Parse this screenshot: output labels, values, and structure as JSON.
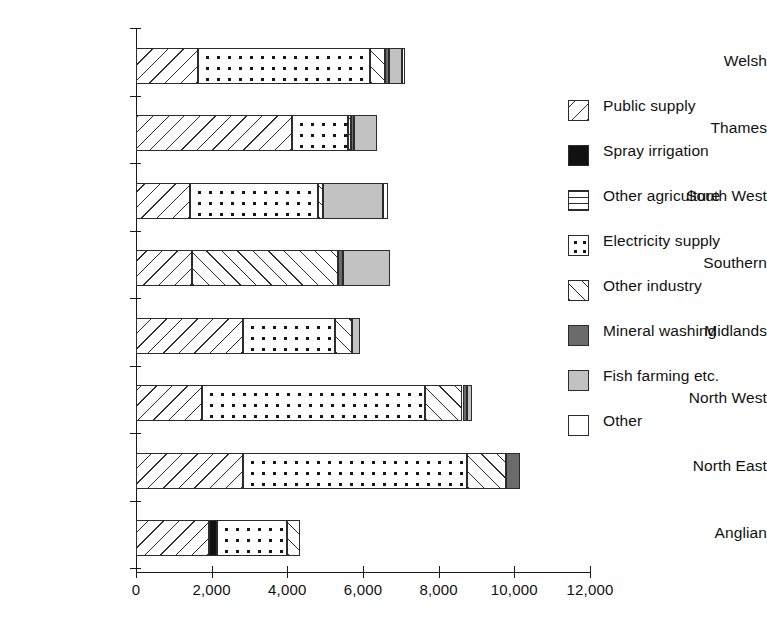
{
  "chart_data": {
    "type": "bar",
    "orientation": "horizontal",
    "stacked": true,
    "title": "",
    "xlabel": "",
    "ylabel": "",
    "xlim": [
      0,
      12000
    ],
    "grid": false,
    "legend_position": "right",
    "x_ticks": [
      0,
      2000,
      4000,
      6000,
      8000,
      10000,
      12000
    ],
    "x_tick_labels": [
      "0",
      "2,000",
      "4,000",
      "6,000",
      "8,000",
      "10,000",
      "12,000"
    ],
    "categories": [
      "Welsh",
      "Thames",
      "South West",
      "Southern",
      "Midlands",
      "North West",
      "North East",
      "Anglian"
    ],
    "series": [
      {
        "name": "Public supply",
        "key": "public",
        "pattern": "diagonal-hatch-backslash",
        "values": [
          1640,
          4130,
          1430,
          1480,
          2830,
          1740,
          2830,
          1930
        ]
      },
      {
        "name": "Spray irrigation",
        "key": "spray",
        "pattern": "solid-black",
        "values": [
          0,
          0,
          0,
          0,
          0,
          0,
          0,
          220
        ]
      },
      {
        "name": "Other agriculture",
        "key": "otheragri",
        "pattern": "horizontal-lines",
        "values": [
          0,
          0,
          0,
          0,
          0,
          0,
          0,
          0
        ]
      },
      {
        "name": "Electricity supply",
        "key": "elec",
        "pattern": "dots",
        "values": [
          4550,
          1480,
          3390,
          0,
          2430,
          5900,
          5920,
          1850
        ]
      },
      {
        "name": "Other industry",
        "key": "otherind",
        "pattern": "diagonal-hatch-slash",
        "values": [
          400,
          80,
          130,
          3860,
          450,
          990,
          1040,
          340
        ]
      },
      {
        "name": "Mineral washing",
        "key": "mineral",
        "pattern": "dark-grey",
        "values": [
          110,
          80,
          0,
          130,
          0,
          130,
          370,
          0
        ]
      },
      {
        "name": "Fish farming etc.",
        "key": "fish",
        "pattern": "light-grey",
        "values": [
          320,
          610,
          1590,
          1240,
          210,
          130,
          0,
          0
        ]
      },
      {
        "name": "Other",
        "key": "other",
        "pattern": "white",
        "values": [
          80,
          0,
          130,
          0,
          0,
          0,
          0,
          0
        ]
      }
    ],
    "totals": [
      7100,
      6380,
      6670,
      6710,
      5920,
      8890,
      10160,
      4340
    ]
  },
  "legend": {
    "items": [
      {
        "label": "Public supply",
        "key": "public"
      },
      {
        "label": "Spray irrigation",
        "key": "spray"
      },
      {
        "label": "Other agriculture",
        "key": "otheragri"
      },
      {
        "label": "Electricity supply",
        "key": "elec"
      },
      {
        "label": "Other industry",
        "key": "otherind"
      },
      {
        "label": "Mineral washing",
        "key": "mineral"
      },
      {
        "label": "Fish farming etc.",
        "key": "fish"
      },
      {
        "label": "Other",
        "key": "other"
      }
    ]
  },
  "colors": {
    "axis": "#1a1a1a",
    "ink": "#2b2b2b",
    "spray": "#111111",
    "mineral": "#6b6b6b",
    "fish": "#c2c2c2",
    "other": "#ffffff",
    "background": "#ffffff"
  }
}
